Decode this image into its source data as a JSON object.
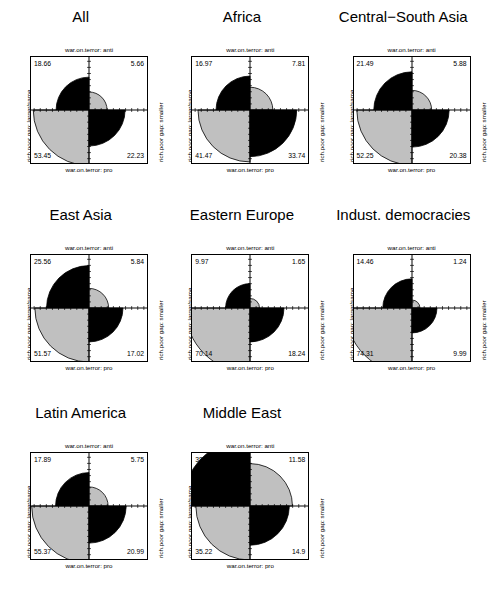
{
  "figure": {
    "type": "fourfold-display-grid",
    "rows": 3,
    "cols": 3,
    "background": "#ffffff",
    "shade_positive": "#000000",
    "shade_negative": "#c0c0c0",
    "axis_color": "#000000"
  },
  "axis_labels": {
    "top": "war.on.terror: anti",
    "bottom": "war.on.terror: pro",
    "left": "rich.poor gap: larger/same",
    "right": "rich.poor gap: smaller"
  },
  "chart_data": {
    "type": "fourfold",
    "title": "",
    "xlabel": "war.on.terror",
    "ylabel": "rich.poor gap",
    "row_levels": [
      "larger/same",
      "smaller"
    ],
    "col_levels": [
      "anti",
      "pro"
    ],
    "grid": false,
    "legend": "none",
    "panels": [
      {
        "title": "All",
        "tl": "18.66",
        "tr": "5.66",
        "bl": "53.45",
        "br": "22.23",
        "tl_v": 18.66,
        "tr_v": 5.66,
        "bl_v": 53.45,
        "br_v": 22.23,
        "r_tl": 0.62,
        "r_tr": 0.34,
        "r_bl": 1.05,
        "r_br": 0.68,
        "c_tl": "#000000",
        "c_tr": "#c0c0c0",
        "c_bl": "#c0c0c0",
        "c_br": "#000000"
      },
      {
        "title": "Africa",
        "tl": "16.97",
        "tr": "7.81",
        "bl": "41.47",
        "br": "33.74",
        "tl_v": 16.97,
        "tr_v": 7.81,
        "bl_v": 41.47,
        "br_v": 33.74,
        "r_tl": 0.64,
        "r_tr": 0.43,
        "r_bl": 0.98,
        "r_br": 0.88,
        "c_tl": "#000000",
        "c_tr": "#c0c0c0",
        "c_bl": "#c0c0c0",
        "c_br": "#000000"
      },
      {
        "title": "Central−South Asia",
        "tl": "21.49",
        "tr": "5.88",
        "bl": "52.25",
        "br": "20.38",
        "tl_v": 21.49,
        "tr_v": 5.88,
        "bl_v": 52.25,
        "br_v": 20.38,
        "r_tl": 0.72,
        "r_tr": 0.37,
        "r_bl": 1.04,
        "r_br": 0.7,
        "c_tl": "#000000",
        "c_tr": "#c0c0c0",
        "c_bl": "#c0c0c0",
        "c_br": "#000000"
      },
      {
        "title": "East Asia",
        "tl": "25.56",
        "tr": "5.84",
        "bl": "51.57",
        "br": "17.02",
        "tl_v": 25.56,
        "tr_v": 5.84,
        "bl_v": 51.57,
        "br_v": 17.02,
        "r_tl": 0.8,
        "r_tr": 0.37,
        "r_bl": 1.02,
        "r_br": 0.64,
        "c_tl": "#000000",
        "c_tr": "#c0c0c0",
        "c_bl": "#c0c0c0",
        "c_br": "#000000"
      },
      {
        "title": "Eastern Europe",
        "tl": "9.97",
        "tr": "1.65",
        "bl": "70.14",
        "br": "18.24",
        "tl_v": 9.97,
        "tr_v": 1.65,
        "bl_v": 70.14,
        "br_v": 18.24,
        "r_tl": 0.46,
        "r_tr": 0.18,
        "r_bl": 1.22,
        "r_br": 0.64,
        "c_tl": "#000000",
        "c_tr": "#c0c0c0",
        "c_bl": "#c0c0c0",
        "c_br": "#000000"
      },
      {
        "title": "Indust. democracies",
        "tl": "14.46",
        "tr": "1.24",
        "bl": "74.31",
        "br": "9.99",
        "tl_v": 14.46,
        "tr_v": 1.24,
        "bl_v": 74.31,
        "br_v": 9.99,
        "r_tl": 0.55,
        "r_tr": 0.15,
        "r_bl": 1.26,
        "r_br": 0.47,
        "c_tl": "#000000",
        "c_tr": "#c0c0c0",
        "c_bl": "#c0c0c0",
        "c_br": "#000000"
      },
      {
        "title": "Latin America",
        "tl": "17.89",
        "tr": "5.75",
        "bl": "55.37",
        "br": "20.99",
        "tl_v": 17.89,
        "tr_v": 5.75,
        "bl_v": 55.37,
        "br_v": 20.99,
        "r_tl": 0.63,
        "r_tr": 0.36,
        "r_bl": 1.08,
        "r_br": 0.7,
        "c_tl": "#000000",
        "c_tr": "#c0c0c0",
        "c_bl": "#c0c0c0",
        "c_br": "#000000"
      },
      {
        "title": "Middle East",
        "tl": "38.3",
        "tr": "11.58",
        "bl": "35.22",
        "br": "14.9",
        "tl_v": 38.3,
        "tr_v": 11.58,
        "bl_v": 35.22,
        "br_v": 14.9,
        "r_tl": 1.28,
        "r_tr": 0.8,
        "r_bl": 1.02,
        "r_br": 0.74,
        "c_tl": "#000000",
        "c_tr": "#c0c0c0",
        "c_bl": "#c0c0c0",
        "c_br": "#000000"
      }
    ]
  }
}
